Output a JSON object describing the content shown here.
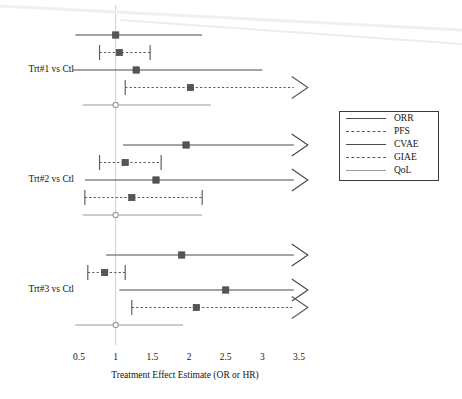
{
  "chart_data": {
    "type": "forest",
    "title": "",
    "xlabel": "Treatment Effect Estimate (OR or HR)",
    "ylabel": "",
    "xlim": [
      0.42,
      3.62
    ],
    "xticks": [
      0.5,
      1,
      1.5,
      2,
      2.5,
      3,
      3.5
    ],
    "xticklabels": [
      "0.5",
      "1",
      "1.5",
      "2",
      "2.5",
      "3",
      "3.5"
    ],
    "reference_line": 1,
    "grid": false,
    "legend_position": "right",
    "legend": [
      {
        "name": "ORR",
        "style": "solid",
        "color": "#4a4a4a"
      },
      {
        "name": "PFS",
        "style": "dashed",
        "color": "#5a5a5a"
      },
      {
        "name": "CVAE",
        "style": "solid",
        "color": "#4a4a4a"
      },
      {
        "name": "GIAE",
        "style": "dashed",
        "color": "#5a5a5a"
      },
      {
        "name": "QoL",
        "style": "solid",
        "color": "#9a9a9a"
      }
    ],
    "groups": [
      {
        "label": "Trt#1 vs Ctl",
        "rows": [
          {
            "endpoint": "ORR",
            "estimate": 1.0,
            "low": 0.45,
            "high": 2.18,
            "style": "solid",
            "caps": false,
            "arrow_right": false,
            "marker": "filled-square",
            "color": "#4a4a4a"
          },
          {
            "endpoint": "PFS",
            "estimate": 1.05,
            "low": 0.78,
            "high": 1.47,
            "style": "dashed",
            "caps": true,
            "arrow_right": false,
            "marker": "filled-square",
            "color": "#5a5a5a"
          },
          {
            "endpoint": "CVAE",
            "estimate": 1.28,
            "low": 0.42,
            "high": 3.0,
            "style": "solid",
            "caps": false,
            "arrow_right": false,
            "marker": "filled-square",
            "color": "#4a4a4a"
          },
          {
            "endpoint": "GIAE",
            "estimate": 2.02,
            "low": 1.13,
            "high": 3.62,
            "style": "dashed",
            "caps": true,
            "arrow_right": true,
            "marker": "filled-square",
            "color": "#5a5a5a"
          },
          {
            "endpoint": "QoL",
            "estimate": 1.0,
            "low": 0.55,
            "high": 2.3,
            "style": "solid",
            "caps": false,
            "arrow_right": false,
            "marker": "open-circle",
            "color": "#9a9a9a"
          }
        ]
      },
      {
        "label": "Trt#2 vs Ctl",
        "rows": [
          {
            "endpoint": "ORR",
            "estimate": 1.96,
            "low": 1.1,
            "high": 3.62,
            "style": "solid",
            "caps": false,
            "arrow_right": true,
            "marker": "filled-square",
            "color": "#4a4a4a"
          },
          {
            "endpoint": "PFS",
            "estimate": 1.13,
            "low": 0.78,
            "high": 1.62,
            "style": "dashed",
            "caps": true,
            "arrow_right": false,
            "marker": "filled-square",
            "color": "#5a5a5a"
          },
          {
            "endpoint": "CVAE",
            "estimate": 1.55,
            "low": 0.58,
            "high": 3.62,
            "style": "solid",
            "caps": false,
            "arrow_right": true,
            "marker": "filled-square",
            "color": "#4a4a4a"
          },
          {
            "endpoint": "GIAE",
            "estimate": 1.22,
            "low": 0.58,
            "high": 2.18,
            "style": "dashed",
            "caps": true,
            "arrow_right": false,
            "marker": "filled-square",
            "color": "#5a5a5a"
          },
          {
            "endpoint": "QoL",
            "estimate": 1.0,
            "low": 0.55,
            "high": 2.18,
            "style": "solid",
            "caps": false,
            "arrow_right": false,
            "marker": "open-circle",
            "color": "#9a9a9a"
          }
        ]
      },
      {
        "label": "Trt#3 vs Ctl",
        "rows": [
          {
            "endpoint": "ORR",
            "estimate": 1.9,
            "low": 0.87,
            "high": 3.62,
            "style": "solid",
            "caps": false,
            "arrow_right": true,
            "marker": "filled-square",
            "color": "#4a4a4a"
          },
          {
            "endpoint": "PFS",
            "estimate": 0.85,
            "low": 0.62,
            "high": 1.13,
            "style": "dashed",
            "caps": true,
            "arrow_right": false,
            "marker": "filled-square",
            "color": "#5a5a5a"
          },
          {
            "endpoint": "CVAE",
            "estimate": 2.5,
            "low": 1.05,
            "high": 3.62,
            "style": "solid",
            "caps": false,
            "arrow_right": true,
            "marker": "filled-square",
            "color": "#4a4a4a"
          },
          {
            "endpoint": "GIAE",
            "estimate": 2.1,
            "low": 1.22,
            "high": 3.62,
            "style": "dashed",
            "caps": true,
            "arrow_right": true,
            "marker": "filled-square",
            "color": "#5a5a5a"
          },
          {
            "endpoint": "QoL",
            "estimate": 1.0,
            "low": 0.45,
            "high": 1.92,
            "style": "solid",
            "caps": false,
            "arrow_right": false,
            "marker": "open-circle",
            "color": "#9a9a9a"
          }
        ]
      }
    ]
  }
}
